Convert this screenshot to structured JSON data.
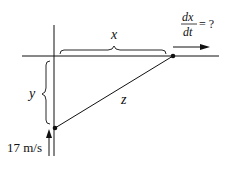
{
  "diagram": {
    "labels": {
      "x": "x",
      "y": "y",
      "z": "z",
      "rate_numerator": "dx",
      "rate_denominator": "dt",
      "rate_equals": "= ?",
      "speed": "17 m/s"
    },
    "colors": {
      "line": "#111111",
      "background": "#ffffff"
    }
  }
}
